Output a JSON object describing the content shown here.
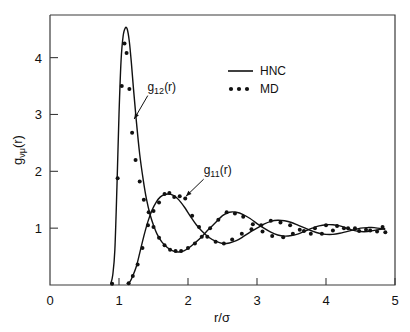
{
  "chart_data": {
    "type": "line",
    "title": "",
    "xlabel": "r/σ",
    "ylabel": "gνμ(r)",
    "ylabel_parts": {
      "base": "g",
      "sub": "νμ",
      "tail": "(r)"
    },
    "xlim": [
      0,
      5
    ],
    "ylim": [
      0,
      4.75
    ],
    "xticks": [
      0,
      1,
      2,
      3,
      4,
      5
    ],
    "xtick_labels": [
      "0",
      "1",
      "2",
      "3",
      "4",
      "5"
    ],
    "yticks": [
      1,
      2,
      3,
      4
    ],
    "ytick_labels": [
      "1",
      "2",
      "3",
      "4"
    ],
    "grid": false,
    "legend_position": "upper-right",
    "legend": [
      {
        "name": "HNC",
        "marker": "line",
        "label": "HNC"
      },
      {
        "name": "MD",
        "marker": "dots",
        "label": "MD"
      }
    ],
    "annotations": [
      {
        "text": "g12(r)",
        "base": "g",
        "sub": "12",
        "tail": "(r)",
        "x": 1.62,
        "y": 3.42,
        "arrow_to_x": 1.22,
        "arrow_to_y": 2.92
      },
      {
        "text": "g11(r)",
        "base": "g",
        "sub": "11",
        "tail": "(r)",
        "x": 2.43,
        "y": 1.95,
        "arrow_to_x": 1.97,
        "arrow_to_y": 1.56
      }
    ],
    "series": [
      {
        "name": "g12(r) HNC",
        "style": "line",
        "x": [
          0.88,
          0.91,
          0.94,
          0.97,
          1.0,
          1.03,
          1.06,
          1.09,
          1.12,
          1.15,
          1.18,
          1.21,
          1.25,
          1.3,
          1.35,
          1.4,
          1.45,
          1.5,
          1.55,
          1.62,
          1.7,
          1.78,
          1.86,
          1.94,
          2.02,
          2.1,
          2.2,
          2.3,
          2.4,
          2.5,
          2.6,
          2.7,
          2.8,
          2.9,
          3.0,
          3.1,
          3.2,
          3.3,
          3.4,
          3.5,
          3.6,
          3.7,
          3.8,
          3.9,
          4.0,
          4.1,
          4.2,
          4.3,
          4.4,
          4.5,
          4.6,
          4.7,
          4.85
        ],
        "y": [
          0.02,
          0.18,
          0.62,
          1.72,
          3.0,
          3.95,
          4.38,
          4.52,
          4.5,
          4.28,
          3.9,
          3.45,
          2.9,
          2.3,
          1.86,
          1.5,
          1.24,
          1.05,
          0.9,
          0.76,
          0.66,
          0.6,
          0.58,
          0.6,
          0.66,
          0.74,
          0.85,
          0.98,
          1.1,
          1.22,
          1.28,
          1.28,
          1.24,
          1.17,
          1.08,
          1.0,
          0.93,
          0.88,
          0.86,
          0.87,
          0.9,
          0.95,
          1.0,
          1.04,
          1.06,
          1.06,
          1.04,
          1.0,
          0.96,
          0.94,
          0.94,
          0.96,
          0.99
        ]
      },
      {
        "name": "g12(r) MD",
        "style": "points",
        "x": [
          0.9,
          0.98,
          1.04,
          1.08,
          1.11,
          1.15,
          1.19,
          1.24,
          1.3,
          1.36,
          1.43,
          1.5,
          1.58,
          1.66,
          1.74,
          1.82,
          1.9,
          2.0,
          2.1,
          2.2,
          2.32,
          2.44,
          2.56,
          2.68,
          2.8,
          2.94,
          3.08,
          3.22,
          3.38,
          3.52,
          3.68,
          3.84,
          4.0,
          4.16,
          4.32,
          4.48,
          4.64,
          4.82
        ],
        "y": [
          0.02,
          1.88,
          3.5,
          4.25,
          4.08,
          3.45,
          2.68,
          2.2,
          1.82,
          1.5,
          1.28,
          1.02,
          0.83,
          0.7,
          0.62,
          0.6,
          0.6,
          0.65,
          0.73,
          0.85,
          1.0,
          1.15,
          1.28,
          1.26,
          1.2,
          1.07,
          0.94,
          0.86,
          0.84,
          0.9,
          0.95,
          1.0,
          1.05,
          1.04,
          1.0,
          0.95,
          0.96,
          1.02
        ]
      },
      {
        "name": "g11(r) HNC",
        "style": "line",
        "x": [
          1.12,
          1.16,
          1.2,
          1.25,
          1.3,
          1.36,
          1.42,
          1.48,
          1.54,
          1.6,
          1.66,
          1.72,
          1.78,
          1.84,
          1.9,
          1.96,
          2.04,
          2.12,
          2.2,
          2.3,
          2.4,
          2.5,
          2.6,
          2.7,
          2.8,
          2.9,
          3.0,
          3.1,
          3.2,
          3.3,
          3.4,
          3.5,
          3.6,
          3.7,
          3.8,
          3.9,
          4.0,
          4.1,
          4.2,
          4.3,
          4.4,
          4.5,
          4.6,
          4.7,
          4.85
        ],
        "y": [
          0.03,
          0.06,
          0.16,
          0.32,
          0.56,
          0.86,
          1.12,
          1.32,
          1.46,
          1.55,
          1.59,
          1.6,
          1.58,
          1.53,
          1.45,
          1.35,
          1.2,
          1.06,
          0.95,
          0.84,
          0.77,
          0.73,
          0.74,
          0.78,
          0.85,
          0.93,
          1.0,
          1.07,
          1.12,
          1.14,
          1.13,
          1.1,
          1.05,
          1.0,
          0.95,
          0.91,
          0.89,
          0.89,
          0.91,
          0.94,
          0.97,
          1.0,
          1.01,
          1.01,
          0.98
        ]
      },
      {
        "name": "g11(r) MD",
        "style": "points",
        "x": [
          1.14,
          1.2,
          1.27,
          1.34,
          1.42,
          1.5,
          1.58,
          1.66,
          1.73,
          1.8,
          1.88,
          1.96,
          2.06,
          2.16,
          2.28,
          2.4,
          2.52,
          2.64,
          2.78,
          2.92,
          3.06,
          3.2,
          3.34,
          3.48,
          3.62,
          3.78,
          3.94,
          4.1,
          4.26,
          4.42,
          4.58,
          4.74,
          4.86
        ],
        "y": [
          0.03,
          0.16,
          0.36,
          0.65,
          1.05,
          1.3,
          1.45,
          1.6,
          1.62,
          1.55,
          1.56,
          1.52,
          1.22,
          1.02,
          0.85,
          0.76,
          0.73,
          0.8,
          0.9,
          0.98,
          1.05,
          1.13,
          1.1,
          1.05,
          0.97,
          0.9,
          0.9,
          0.96,
          1.0,
          1.0,
          0.97,
          0.94,
          0.93
        ]
      }
    ]
  },
  "legend_box": {
    "hnc_label": "HNC",
    "md_label": "MD"
  },
  "axes": {
    "x_title": "r/σ",
    "y_title": "gνμ(r)"
  }
}
